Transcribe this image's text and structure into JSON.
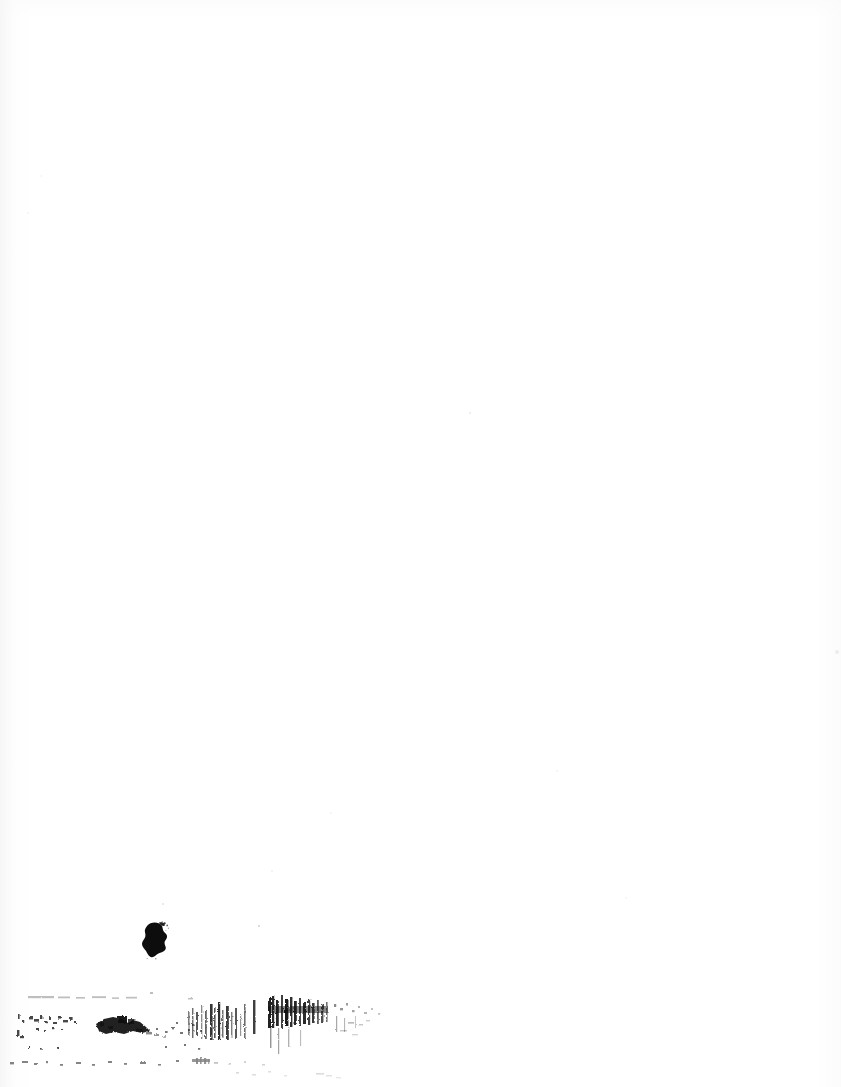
{
  "page": {
    "kind": "scanned-document-page",
    "width": 841,
    "height": 1087,
    "background_color": "#ffffff",
    "ink_color": "#101010",
    "smudge_color": "#1b1b1b",
    "speck_color": "#9a9a9a",
    "visible_text": "",
    "blank_note": "Blank scanned page — no printed text content",
    "orientation": "portrait"
  },
  "artifacts": {
    "ink_blot": {
      "label": "ink-blot",
      "x": 141,
      "y": 921,
      "width": 32,
      "height": 40,
      "color": "#0d0d0d"
    },
    "smudge_band": {
      "label": "scanner-smudge-band",
      "x": 0,
      "y": 986,
      "width": 400,
      "height": 101,
      "color": "#1b1b1b",
      "description": "horizontal band of toner streaks and speckle along bottom edge"
    },
    "specks": [
      {
        "label": "speck-1",
        "x": 469,
        "y": 412,
        "size": 2,
        "opacity": 0.22
      },
      {
        "label": "speck-2",
        "x": 835,
        "y": 650,
        "size": 4,
        "opacity": 0.16
      },
      {
        "label": "speck-3",
        "x": 258,
        "y": 925,
        "size": 2,
        "opacity": 0.45
      },
      {
        "label": "speck-4",
        "x": 330,
        "y": 812,
        "size": 2,
        "opacity": 0.13
      },
      {
        "label": "speck-5",
        "x": 556,
        "y": 770,
        "size": 2,
        "opacity": 0.12
      },
      {
        "label": "speck-6",
        "x": 162,
        "y": 903,
        "size": 2,
        "opacity": 0.3
      },
      {
        "label": "speck-7",
        "x": 625,
        "y": 897,
        "size": 2,
        "opacity": 0.12
      },
      {
        "label": "speck-8",
        "x": 271,
        "y": 870,
        "size": 2,
        "opacity": 0.14
      },
      {
        "label": "speck-9",
        "x": 40,
        "y": 175,
        "size": 2,
        "opacity": 0.1
      },
      {
        "label": "speck-10",
        "x": 27,
        "y": 212,
        "size": 2,
        "opacity": 0.12
      }
    ]
  }
}
